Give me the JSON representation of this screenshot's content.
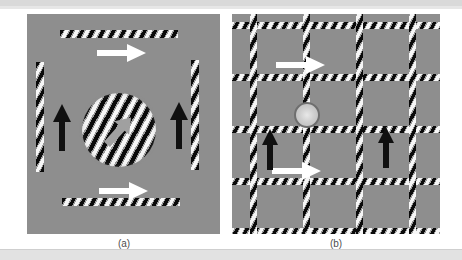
{
  "figure": {
    "caption_a": "(a)",
    "caption_b": "(b)",
    "background_color": "#8e8e8e",
    "page_background": "#ffffff",
    "top_band_color": "#d9d9d9",
    "bottom_band_color": "#e2e2e2"
  },
  "panel_a": {
    "label": "(a)",
    "description": "Four separate oblique gratings arranged around a central circular oblique grating",
    "elements": [
      {
        "name": "bar-top",
        "type": "oblique-grating-bar",
        "orientation": "horizontal",
        "motion_arrow": "right",
        "arrow_color": "#ffffff"
      },
      {
        "name": "bar-bottom",
        "type": "oblique-grating-bar",
        "orientation": "horizontal",
        "motion_arrow": "right",
        "arrow_color": "#ffffff"
      },
      {
        "name": "bar-left",
        "type": "oblique-grating-bar",
        "orientation": "vertical",
        "motion_arrow": "up",
        "arrow_color": "#000000"
      },
      {
        "name": "bar-right",
        "type": "oblique-grating-bar",
        "orientation": "vertical",
        "motion_arrow": "up",
        "arrow_color": "#000000"
      },
      {
        "name": "center-grating",
        "type": "circular-oblique-grating",
        "motion_arrow": "up-right",
        "arrow_color": "#9b9b9b"
      }
    ],
    "stripe_angle_deg": 118,
    "arrow_labels": {
      "right": "rightward motion",
      "up": "upward motion",
      "up_right": "resultant diagonal motion"
    }
  },
  "panel_b": {
    "label": "(b)",
    "description": "Plaid grid of oblique gratings with central fixation marker",
    "grid": {
      "rows": 4,
      "cols": 4,
      "line_color_dark": "#0a0a0a",
      "line_color_light": "#f6f6f6"
    },
    "elements": [
      {
        "name": "fixation-marker",
        "type": "circular-fixation-point"
      },
      {
        "name": "arrow-top",
        "motion_arrow": "right",
        "arrow_color": "#ffffff"
      },
      {
        "name": "arrow-mid",
        "motion_arrow": "right",
        "arrow_color": "#ffffff"
      },
      {
        "name": "arrow-left",
        "motion_arrow": "up",
        "arrow_color": "#000000"
      },
      {
        "name": "arrow-right",
        "motion_arrow": "up",
        "arrow_color": "#000000"
      }
    ],
    "stripe_angle_deg": 118
  }
}
